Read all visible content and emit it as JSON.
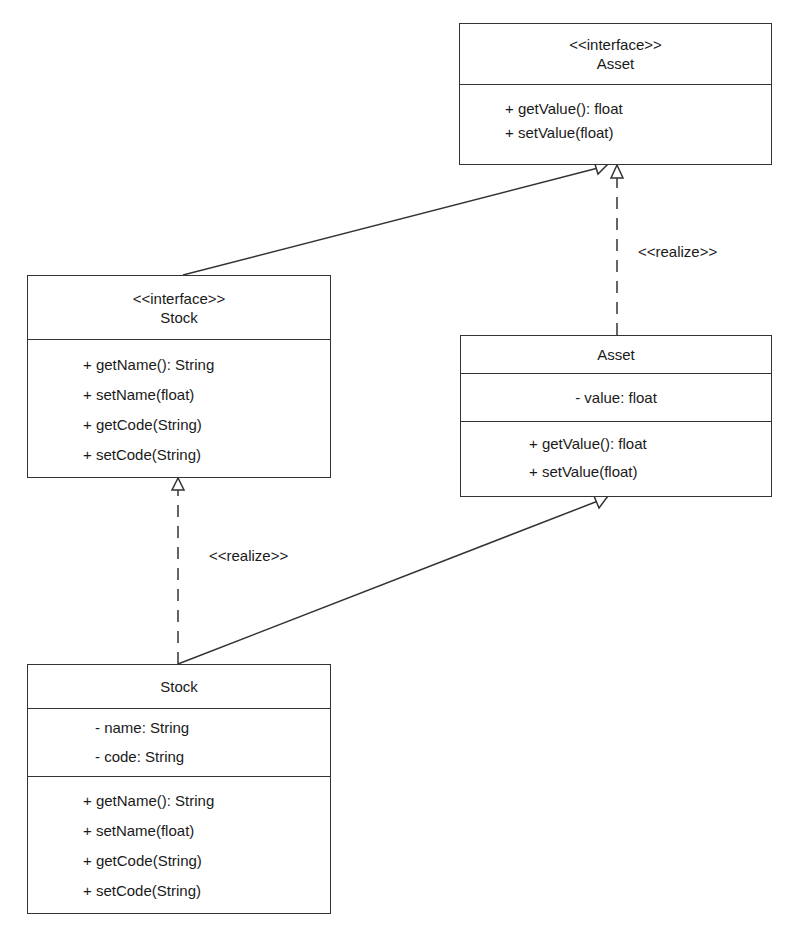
{
  "classes": {
    "asset_interface": {
      "stereotype": "<<interface>>",
      "name": "Asset",
      "attributes": [],
      "operations": [
        "+ getValue(): float",
        "+ setValue(float)"
      ]
    },
    "stock_interface": {
      "stereotype": "<<interface>>",
      "name": "Stock",
      "attributes": [],
      "operations": [
        "+ getName(): String",
        "+ setName(float)",
        "+ getCode(String)",
        "+ setCode(String)"
      ]
    },
    "asset_class": {
      "name": "Asset",
      "attributes": [
        "- value: float"
      ],
      "operations": [
        "+ getValue(): float",
        "+ setValue(float)"
      ]
    },
    "stock_class": {
      "name": "Stock",
      "attributes": [
        "- name: String",
        "- code: String"
      ],
      "operations": [
        "+ getName(): String",
        "+ setName(float)",
        "+ getCode(String)",
        "+ setCode(String)"
      ]
    }
  },
  "relationships": {
    "asset_realize_label": "<<realize>>",
    "stock_realize_label": "<<realize>>"
  },
  "colors": {
    "line": "#333333",
    "background": "#ffffff",
    "text": "#1a1a1a"
  }
}
